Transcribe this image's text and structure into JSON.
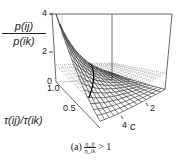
{
  "chart_data": {
    "type": "surface3d",
    "title": "",
    "zlabel_numerator": "p(ij)",
    "zlabel_denominator": "p(ik)",
    "xlabel": "τ(ij)/τ(ik)",
    "ylabel": "c",
    "z_ticks": [
      "4",
      "2",
      "0"
    ],
    "x_ticks": [
      "1.0",
      "0.5"
    ],
    "y_ticks": [
      "2",
      "4"
    ],
    "zlim": [
      0,
      4
    ],
    "xlim": [
      0,
      1
    ],
    "ylim": [
      0,
      5
    ],
    "series": [
      {
        "name": "ratio surface",
        "style": "solid mesh",
        "description": "decays from ~4 at τ ratio→0, c small toward ~0 at high c"
      },
      {
        "name": "reference plane z=1",
        "style": "dotted mesh"
      }
    ],
    "sample_values": {
      "x": [
        0.1,
        0.25,
        0.5,
        0.75,
        1.0
      ],
      "c": [
        0,
        1,
        2,
        3,
        4
      ],
      "z_at_c0": [
        3.8,
        2.8,
        2.0,
        1.4,
        1.0
      ]
    }
  },
  "caption": {
    "prefix": "(a)",
    "numerator": "η_ij",
    "denominator": "η_ik",
    "relation": "> 1"
  }
}
